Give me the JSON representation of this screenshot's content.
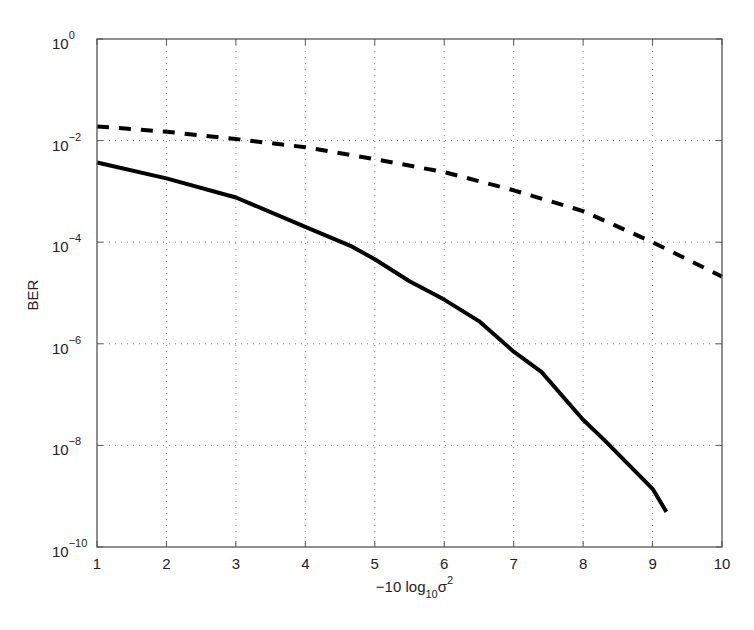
{
  "chart_data": {
    "type": "line",
    "title": "",
    "xlabel": "−10 log₁₀σ²",
    "xlabel_parts": {
      "prefix": "−10 log",
      "sub": "10",
      "base": "σ",
      "sup": "2"
    },
    "ylabel": "BER",
    "xlim": [
      1,
      10
    ],
    "ylim": [
      1e-10,
      1
    ],
    "yscale": "log",
    "grid": true,
    "legend": null,
    "x_ticks": [
      1,
      2,
      3,
      4,
      5,
      6,
      7,
      8,
      9,
      10
    ],
    "x_tick_labels": [
      "1",
      "2",
      "3",
      "4",
      "5",
      "6",
      "7",
      "8",
      "9",
      "10"
    ],
    "y_ticks_exp": [
      0,
      -2,
      -4,
      -6,
      -8,
      -10
    ],
    "y_tick_labels": [
      "10^0",
      "10^-2",
      "10^-4",
      "10^-6",
      "10^-8",
      "10^-10"
    ],
    "series": [
      {
        "name": "dashed curve",
        "style": "dashed",
        "color": "#000000",
        "x": [
          1,
          2,
          3,
          4,
          5,
          6,
          7,
          8,
          9,
          10
        ],
        "y": [
          0.019,
          0.015,
          0.0107,
          0.0074,
          0.0043,
          0.0024,
          0.00105,
          0.00041,
          0.0001,
          2.1e-05
        ]
      },
      {
        "name": "solid curve",
        "style": "solid",
        "color": "#000000",
        "x": [
          1,
          2,
          3,
          4,
          4.65,
          5,
          5.5,
          6,
          6.5,
          7,
          7.4,
          8,
          8.3,
          9,
          9.2
        ],
        "y": [
          0.0037,
          0.0018,
          0.00076,
          0.0002,
          8.5e-05,
          4.6e-05,
          1.7e-05,
          7.4e-06,
          2.8e-06,
          7e-07,
          2.8e-07,
          3.2e-08,
          1.3e-08,
          1.4e-09,
          4.9e-10
        ]
      }
    ]
  },
  "y_axis_label": "BER"
}
